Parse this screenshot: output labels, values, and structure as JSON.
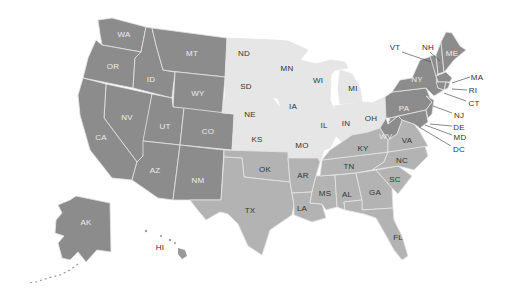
{
  "colors": {
    "region_dark": "#8c8c8c",
    "region_light": "#e6e6e6",
    "region_medium": "#b3b3b3",
    "label_on_dark": "#ececec",
    "label_on_light": "#333333",
    "border": "#e4e4e4",
    "background": "#ffffff"
  },
  "states": [
    {
      "abbr": "WA",
      "region": "dark",
      "x": 124,
      "y": 34
    },
    {
      "abbr": "OR",
      "region": "dark",
      "x": 113,
      "y": 66
    },
    {
      "abbr": "ID",
      "region": "dark",
      "x": 151,
      "y": 79
    },
    {
      "abbr": "MT",
      "region": "dark",
      "x": 192,
      "y": 53
    },
    {
      "abbr": "WY",
      "region": "dark",
      "x": 198,
      "y": 93
    },
    {
      "abbr": "NV",
      "region": "dark",
      "x": 127,
      "y": 117
    },
    {
      "abbr": "UT",
      "region": "dark",
      "x": 165,
      "y": 126
    },
    {
      "abbr": "CO",
      "region": "dark",
      "x": 208,
      "y": 131
    },
    {
      "abbr": "CA",
      "region": "dark",
      "x": 101,
      "y": 137
    },
    {
      "abbr": "AZ",
      "region": "dark",
      "x": 155,
      "y": 170
    },
    {
      "abbr": "NM",
      "region": "dark",
      "x": 198,
      "y": 180
    },
    {
      "abbr": "AK",
      "region": "dark",
      "x": 86,
      "y": 222
    },
    {
      "abbr": "HI",
      "region": "dark_text_only",
      "x": 160,
      "y": 247
    },
    {
      "abbr": "ND",
      "region": "light",
      "x": 244,
      "y": 53
    },
    {
      "abbr": "SD",
      "region": "light",
      "x": 246,
      "y": 86
    },
    {
      "abbr": "NE",
      "region": "light",
      "x": 250,
      "y": 114
    },
    {
      "abbr": "KS",
      "region": "light",
      "x": 257,
      "y": 139
    },
    {
      "abbr": "MN",
      "region": "light",
      "x": 287,
      "y": 68
    },
    {
      "abbr": "IA",
      "region": "light",
      "x": 293,
      "y": 106
    },
    {
      "abbr": "MO",
      "region": "light",
      "x": 302,
      "y": 145
    },
    {
      "abbr": "WI",
      "region": "light",
      "x": 318,
      "y": 80
    },
    {
      "abbr": "IL",
      "region": "light",
      "x": 324,
      "y": 125
    },
    {
      "abbr": "MI",
      "region": "light",
      "x": 353,
      "y": 88
    },
    {
      "abbr": "IN",
      "region": "light",
      "x": 346,
      "y": 123
    },
    {
      "abbr": "OH",
      "region": "light",
      "x": 371,
      "y": 118
    },
    {
      "abbr": "OK",
      "region": "medium",
      "x": 265,
      "y": 169
    },
    {
      "abbr": "TX",
      "region": "medium",
      "x": 250,
      "y": 210
    },
    {
      "abbr": "AR",
      "region": "medium",
      "x": 303,
      "y": 175
    },
    {
      "abbr": "LA",
      "region": "medium",
      "x": 302,
      "y": 208
    },
    {
      "abbr": "MS",
      "region": "medium",
      "x": 325,
      "y": 193
    },
    {
      "abbr": "AL",
      "region": "medium",
      "x": 347,
      "y": 194
    },
    {
      "abbr": "TN",
      "region": "medium",
      "x": 349,
      "y": 166
    },
    {
      "abbr": "KY",
      "region": "medium",
      "x": 363,
      "y": 148
    },
    {
      "abbr": "GA",
      "region": "medium",
      "x": 375,
      "y": 192
    },
    {
      "abbr": "FL",
      "region": "medium",
      "x": 398,
      "y": 237
    },
    {
      "abbr": "SC",
      "region": "medium",
      "x": 395,
      "y": 179
    },
    {
      "abbr": "NC",
      "region": "medium",
      "x": 402,
      "y": 160
    },
    {
      "abbr": "VA",
      "region": "medium",
      "x": 407,
      "y": 140
    },
    {
      "abbr": "WV",
      "region": "dark",
      "x": 386,
      "y": 136
    },
    {
      "abbr": "PA",
      "region": "dark",
      "x": 404,
      "y": 108
    },
    {
      "abbr": "NY",
      "region": "dark",
      "x": 417,
      "y": 79
    },
    {
      "abbr": "ME",
      "region": "dark",
      "x": 452,
      "y": 53
    }
  ],
  "callouts": [
    {
      "abbr": "VT",
      "x": 395,
      "y": 47,
      "lx1": 402,
      "ly1": 52,
      "lx2": 431,
      "ly2": 62
    },
    {
      "abbr": "NH",
      "x": 428,
      "y": 47,
      "lx1": 430,
      "ly1": 52,
      "lx2": 440,
      "ly2": 61
    },
    {
      "abbr": "MA",
      "x": 477,
      "y": 77,
      "lx1": 470,
      "ly1": 77,
      "lx2": 452,
      "ly2": 83
    },
    {
      "abbr": "RI",
      "x": 473,
      "y": 90,
      "lx1": 467,
      "ly1": 90,
      "lx2": 452,
      "ly2": 89
    },
    {
      "abbr": "CT",
      "x": 474,
      "y": 103,
      "lx1": 466,
      "ly1": 101,
      "lx2": 444,
      "ly2": 93
    },
    {
      "abbr": "NJ",
      "x": 459,
      "y": 115,
      "lx1": 452,
      "ly1": 113,
      "lx2": 433,
      "ly2": 106
    },
    {
      "abbr": "DE",
      "x": 459,
      "y": 127,
      "lx1": 452,
      "ly1": 126,
      "lx2": 430,
      "ly2": 124
    },
    {
      "abbr": "MD",
      "x": 460,
      "y": 137,
      "lx1": 452,
      "ly1": 135,
      "lx2": 425,
      "ly2": 125
    },
    {
      "abbr": "DC",
      "x": 459,
      "y": 149,
      "lx1": 451,
      "ly1": 146,
      "lx2": 419,
      "ly2": 127
    }
  ]
}
